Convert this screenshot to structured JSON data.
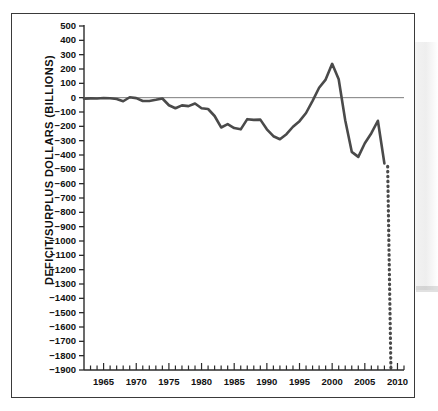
{
  "figure": {
    "name": "federal-deficit-surplus-line-chart",
    "background_color": "#ffffff",
    "frame_color": "#3a3a3a",
    "line_color": "#4a4a4a",
    "axis_color": "#2b2b2b"
  },
  "chart_data": {
    "type": "line",
    "title": "",
    "xlabel": "",
    "ylabel": "DEFICIT/SURPLUS DOLLARS (BILLIONS)",
    "xlim": [
      1962,
      2011
    ],
    "ylim": [
      -1900,
      500
    ],
    "grid": false,
    "legend": null,
    "zero_reference_line": 0,
    "x_tick_labels": [
      "1965",
      "1970",
      "1975",
      "1980",
      "1985",
      "1990",
      "1995",
      "2000",
      "2005",
      "2010"
    ],
    "x_tick_values": [
      1965,
      1970,
      1975,
      1980,
      1985,
      1990,
      1995,
      2000,
      2005,
      2010
    ],
    "x_minor_tick_interval": 1,
    "y_tick_labels": [
      "500",
      "400",
      "300",
      "200",
      "100",
      "0",
      "−100",
      "−200",
      "−300",
      "−400",
      "−500",
      "−600",
      "−700",
      "−800",
      "−900",
      "−1000",
      "−1100",
      "−1200",
      "−1300",
      "−1400",
      "−1500",
      "−1600",
      "−1700",
      "−1800",
      "−1900"
    ],
    "y_tick_values": [
      500,
      400,
      300,
      200,
      100,
      0,
      -100,
      -200,
      -300,
      -400,
      -500,
      -600,
      -700,
      -800,
      -900,
      -1000,
      -1100,
      -1200,
      -1300,
      -1400,
      -1500,
      -1600,
      -1700,
      -1800,
      -1900
    ],
    "series": [
      {
        "name": "actual-deficit-surplus",
        "style": "solid",
        "x": [
          1962,
          1963,
          1964,
          1965,
          1966,
          1967,
          1968,
          1969,
          1970,
          1971,
          1972,
          1973,
          1974,
          1975,
          1976,
          1977,
          1978,
          1979,
          1980,
          1981,
          1982,
          1983,
          1984,
          1985,
          1986,
          1987,
          1988,
          1989,
          1990,
          1991,
          1992,
          1993,
          1994,
          1995,
          1996,
          1997,
          1998,
          1999,
          2000,
          2001,
          2002,
          2003,
          2004,
          2005,
          2006,
          2007,
          2008
        ],
        "values": [
          -7,
          -5,
          -6,
          -2,
          -4,
          -9,
          -25,
          3,
          -3,
          -23,
          -23,
          -15,
          -6,
          -53,
          -74,
          -54,
          -59,
          -41,
          -74,
          -79,
          -128,
          -208,
          -185,
          -212,
          -221,
          -150,
          -155,
          -153,
          -221,
          -269,
          -290,
          -255,
          -203,
          -164,
          -107,
          -22,
          69,
          126,
          236,
          128,
          -158,
          -378,
          -413,
          -318,
          -248,
          -161,
          -459
        ]
      },
      {
        "name": "projected-deficit",
        "style": "dotted",
        "x": [
          2008.5,
          2009
        ],
        "values": [
          -480,
          -1900
        ]
      }
    ]
  }
}
